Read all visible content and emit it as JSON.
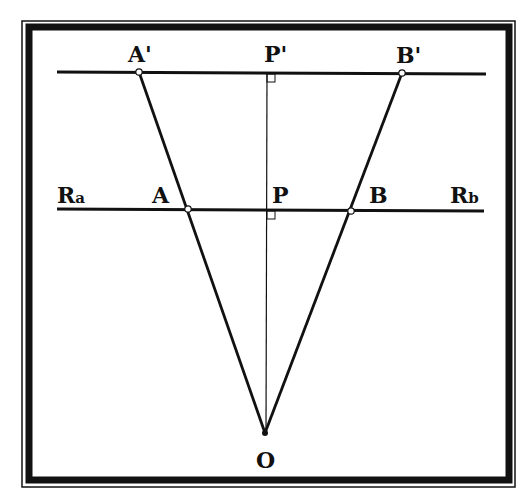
{
  "colors": {
    "background": "#ffffff",
    "ink": "#111111",
    "frame": "#111111"
  },
  "labels": {
    "a_prime": "A'",
    "p_prime": "P'",
    "b_prime": "B'",
    "r_a_main": "R",
    "r_a_sub": "a",
    "a": "A",
    "p": "P",
    "b": "B",
    "r_b_main": "R",
    "r_b_sub": "b",
    "o": "O"
  },
  "geometry": {
    "top_line": {
      "x1": 57,
      "y1": 72,
      "x2": 486,
      "y2": 74
    },
    "middle_line": {
      "x1": 57,
      "y1": 209,
      "x2": 484,
      "y2": 211
    },
    "perpendicular": {
      "x1": 267,
      "y1": 73,
      "x2": 266,
      "y2": 433
    },
    "points": {
      "A_prime": [
        139,
        72
      ],
      "B_prime": [
        402,
        73
      ],
      "A": [
        188,
        209
      ],
      "B": [
        351,
        211
      ],
      "O": [
        265,
        433
      ]
    }
  }
}
